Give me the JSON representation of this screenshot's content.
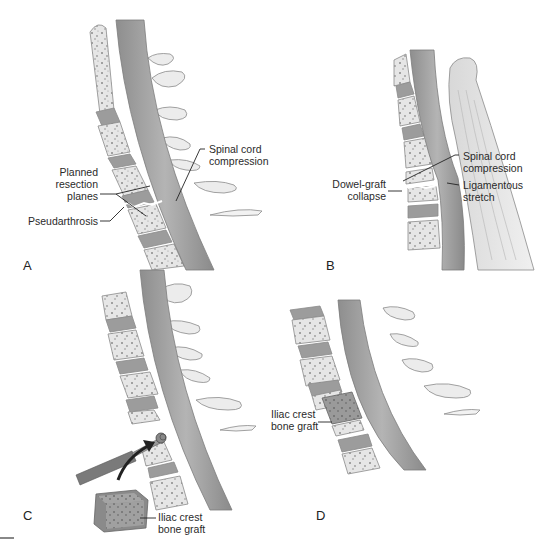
{
  "figure": {
    "panels": [
      {
        "id": "A",
        "letter": "A",
        "labels": {
          "planned_resection_planes": [
            "Planned",
            "resection",
            "planes"
          ],
          "pseudarthrosis": "Pseudarthrosis",
          "spinal_cord_compression": [
            "Spinal cord",
            "compression"
          ]
        }
      },
      {
        "id": "B",
        "letter": "B",
        "labels": {
          "dowel_graft_collapse": [
            "Dowel-graft",
            "collapse"
          ],
          "spinal_cord_compression": [
            "Spinal cord",
            "compression"
          ],
          "ligamentous_stretch": [
            "Ligamentous",
            "stretch"
          ]
        }
      },
      {
        "id": "C",
        "letter": "C",
        "labels": {
          "iliac_crest_bone_graft": [
            "Iliac crest",
            "bone graft"
          ]
        }
      },
      {
        "id": "D",
        "letter": "D",
        "labels": {
          "iliac_crest_bone_graft": [
            "Iliac crest",
            "bone graft"
          ]
        }
      }
    ],
    "colors": {
      "bone": "#e9e9e9",
      "bone_speckle": "#8a8a8a",
      "disc": "#9c9c9c",
      "cord": "#a9a9a9",
      "cord_dark": "#8c8c8c",
      "process": "#ececec",
      "outline": "#7a7a7a",
      "leader": "#222222",
      "graft": "#8f8f8f"
    }
  }
}
